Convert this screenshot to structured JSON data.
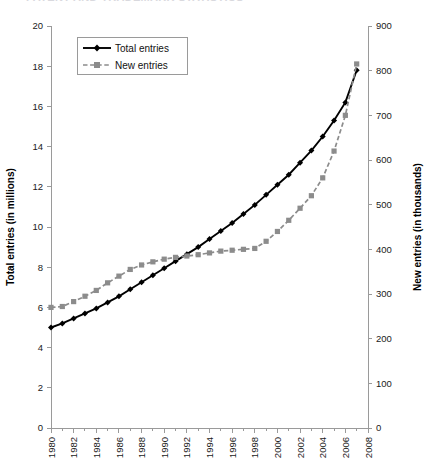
{
  "page": {
    "cut_header_text": "PATENT AND TRADEMARK STATISTICS"
  },
  "legend": {
    "position": "top-left-inside",
    "entries": [
      {
        "label": "Total entries",
        "color": "#000000",
        "style": "solid",
        "marker": "diamond"
      },
      {
        "label": "New entries",
        "color": "#8c8c8c",
        "style": "dashed",
        "marker": "square"
      }
    ]
  },
  "chart_data": {
    "type": "line",
    "title": "",
    "subtitle": "",
    "xlabel": "",
    "ylabel": "Total entries (in millions)",
    "y2label": "New entries (in thousands)",
    "grid": false,
    "legend_position": "upper left",
    "xlim": [
      1980,
      2008
    ],
    "ylim": [
      0,
      20
    ],
    "y2lim": [
      0,
      900
    ],
    "ytick_step": 2,
    "y2tick_step": 100,
    "xtick_step": 1,
    "xticklabel_step": 2,
    "xticklabel_rotation": 90,
    "x": [
      1980,
      1981,
      1982,
      1983,
      1984,
      1985,
      1986,
      1987,
      1988,
      1989,
      1990,
      1991,
      1992,
      1993,
      1994,
      1995,
      1996,
      1997,
      1998,
      1999,
      2000,
      2001,
      2002,
      2003,
      2004,
      2005,
      2006,
      2007,
      2008
    ],
    "xticklabels": [
      "1980",
      "1982",
      "1984",
      "1986",
      "1988",
      "1990",
      "1992",
      "1994",
      "1996",
      "1998",
      "2000",
      "2002",
      "2004",
      "2006",
      "2008"
    ],
    "yticklabels": [
      "0",
      "2",
      "4",
      "6",
      "8",
      "10",
      "12",
      "14",
      "16",
      "18",
      "20"
    ],
    "y2ticklabels": [
      "0",
      "100",
      "200",
      "300",
      "400",
      "500",
      "600",
      "700",
      "800",
      "900"
    ],
    "series": [
      {
        "name": "Total entries",
        "axis": "left",
        "units": "millions",
        "color": "#000000",
        "marker": "diamond",
        "linestyle": "solid",
        "values": [
          5.0,
          5.2,
          5.45,
          5.7,
          5.95,
          6.25,
          6.55,
          6.9,
          7.25,
          7.6,
          7.95,
          8.3,
          8.65,
          9.0,
          9.4,
          9.8,
          10.2,
          10.65,
          11.1,
          11.6,
          12.1,
          12.6,
          13.2,
          13.8,
          14.5,
          15.3,
          16.2,
          17.8,
          null
        ]
      },
      {
        "name": "New entries",
        "axis": "right",
        "units": "thousands",
        "color": "#8c8c8c",
        "marker": "square",
        "linestyle": "dashed",
        "values": [
          270,
          272,
          283,
          295,
          308,
          325,
          340,
          355,
          365,
          372,
          378,
          382,
          385,
          388,
          392,
          396,
          398,
          400,
          402,
          418,
          440,
          465,
          492,
          520,
          560,
          620,
          700,
          815,
          null
        ]
      }
    ],
    "annotations": []
  }
}
